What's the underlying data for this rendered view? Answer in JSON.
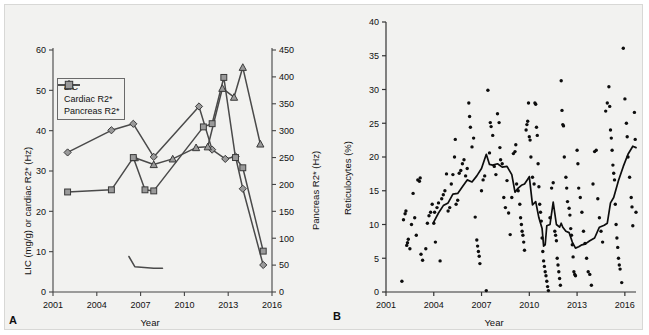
{
  "figure": {
    "background": "#f2f2f0",
    "panels": [
      "A",
      "B"
    ]
  },
  "panelA": {
    "letter": "A",
    "legend": {
      "items": [
        {
          "label": "LIC",
          "marker": "diamond-marker-icon",
          "color": "#8c8c8c"
        },
        {
          "label": "Cardiac R2*",
          "marker": "triangle-marker-icon",
          "color": "#8c8c8c"
        },
        {
          "label": "Pancreas R2*",
          "marker": "square-marker-icon",
          "color": "#8c8c8c"
        }
      ]
    },
    "chart_data": {
      "type": "line",
      "title": "",
      "xlabel": "Year",
      "ylabel": "LIC (mg/g) or cardiac R2* (Hz)",
      "ylabel_right": "Pancreas R2* (Hz)",
      "xlim": [
        2001,
        2016
      ],
      "xticks": [
        2001,
        2004,
        2007,
        2010,
        2013,
        2016
      ],
      "ylim": [
        0,
        60
      ],
      "yticks": [
        0,
        10,
        20,
        30,
        40,
        50,
        60
      ],
      "ylim_right": [
        0,
        450
      ],
      "yticks_right": [
        0,
        50,
        100,
        150,
        200,
        250,
        300,
        350,
        400,
        450
      ],
      "grid": false,
      "legend_position": "upper-left",
      "series": [
        {
          "name": "LIC",
          "axis": "left",
          "unit": "mg/g",
          "marker": "diamond",
          "x": [
            2002.0,
            2005.0,
            2006.5,
            2007.9,
            2011.0,
            2011.9,
            2012.8,
            2013.5,
            2014.0,
            2015.4
          ],
          "y": [
            34.6,
            40.1,
            41.7,
            33.5,
            46.0,
            35.3,
            33.0,
            33.6,
            25.6,
            6.7
          ]
        },
        {
          "name": "Cardiac R2*",
          "axis": "left",
          "unit": "Hz",
          "marker": "triangle",
          "x": [
            2006.6,
            2007.9,
            2009.2,
            2010.8,
            2011.6,
            2012.6,
            2013.4,
            2014.0,
            2015.2
          ],
          "y": [
            33.3,
            31.6,
            33.0,
            35.8,
            36.0,
            50.5,
            48.3,
            55.7,
            36.7
          ]
        },
        {
          "name": "Pancreas R2*",
          "axis": "right",
          "unit": "Hz",
          "marker": "square",
          "x": [
            2002.0,
            2005.0,
            2006.5,
            2007.3,
            2007.9,
            2011.3,
            2011.9,
            2012.7,
            2013.5,
            2014.0,
            2015.4
          ],
          "y": [
            186,
            190,
            250,
            190,
            188,
            307,
            313,
            399,
            250,
            231,
            76
          ]
        },
        {
          "name": "Pancreas R2* (early segment)",
          "axis": "right",
          "unit": "Hz",
          "marker": "none",
          "x": [
            2006.2,
            2006.6,
            2007.9,
            2008.5
          ],
          "y": [
            66,
            47,
            44,
            44
          ]
        }
      ]
    }
  },
  "panelB": {
    "letter": "B",
    "chart_data": {
      "type": "scatter",
      "title": "",
      "xlabel": "Year",
      "ylabel": "Reticulocytes (%)",
      "xlim": [
        2001,
        2016.7
      ],
      "xticks": [
        2001,
        2004,
        2007,
        2010,
        2013,
        2016
      ],
      "ylim": [
        0,
        40
      ],
      "yticks": [
        0,
        5,
        10,
        15,
        20,
        25,
        30,
        35,
        40
      ],
      "grid": false,
      "legend_position": "none",
      "series": [
        {
          "name": "Reticulocytes measurements",
          "marker": "dot",
          "points": [
            [
              2002.0,
              1.6
            ],
            [
              2002.1,
              10.7
            ],
            [
              2002.2,
              11.6
            ],
            [
              2002.25,
              12.0
            ],
            [
              2002.3,
              6.9
            ],
            [
              2002.35,
              7.3
            ],
            [
              2002.4,
              7.8
            ],
            [
              2002.5,
              6.4
            ],
            [
              2002.6,
              10.0
            ],
            [
              2002.7,
              14.6
            ],
            [
              2002.8,
              11.0
            ],
            [
              2002.9,
              8.4
            ],
            [
              2003.0,
              16.6
            ],
            [
              2003.1,
              16.4
            ],
            [
              2003.15,
              16.9
            ],
            [
              2003.2,
              5.6
            ],
            [
              2003.3,
              4.7
            ],
            [
              2003.5,
              6.4
            ],
            [
              2003.6,
              10.2
            ],
            [
              2003.7,
              11.3
            ],
            [
              2003.8,
              11.8
            ],
            [
              2003.9,
              13.0
            ],
            [
              2004.0,
              10.2
            ],
            [
              2004.05,
              11.8
            ],
            [
              2004.1,
              7.4
            ],
            [
              2004.2,
              12.5
            ],
            [
              2004.3,
              13.2
            ],
            [
              2004.4,
              4.6
            ],
            [
              2004.5,
              13.8
            ],
            [
              2004.6,
              14.4
            ],
            [
              2004.7,
              15.0
            ],
            [
              2004.8,
              17.5
            ],
            [
              2004.9,
              12.0
            ],
            [
              2005.0,
              12.5
            ],
            [
              2005.1,
              16.0
            ],
            [
              2005.2,
              17.4
            ],
            [
              2005.3,
              20.0
            ],
            [
              2005.35,
              22.6
            ],
            [
              2005.4,
              13.0
            ],
            [
              2005.5,
              13.6
            ],
            [
              2005.6,
              17.6
            ],
            [
              2005.7,
              18.0
            ],
            [
              2005.8,
              19.0
            ],
            [
              2005.9,
              19.6
            ],
            [
              2006.0,
              17.2
            ],
            [
              2006.1,
              18.3
            ],
            [
              2006.2,
              28.0
            ],
            [
              2006.25,
              26.0
            ],
            [
              2006.3,
              24.4
            ],
            [
              2006.4,
              21.5
            ],
            [
              2006.5,
              22.8
            ],
            [
              2006.6,
              11.1
            ],
            [
              2006.7,
              7.7
            ],
            [
              2006.75,
              6.8
            ],
            [
              2006.8,
              6.0
            ],
            [
              2006.85,
              5.3
            ],
            [
              2006.9,
              4.2
            ],
            [
              2007.0,
              15.0
            ],
            [
              2007.1,
              16.6
            ],
            [
              2007.2,
              17.2
            ],
            [
              2007.3,
              0.2
            ],
            [
              2007.4,
              29.9
            ],
            [
              2007.5,
              20.6
            ],
            [
              2007.55,
              25.1
            ],
            [
              2007.6,
              24.5
            ],
            [
              2007.7,
              23.2
            ],
            [
              2007.8,
              18.6
            ],
            [
              2007.9,
              17.4
            ],
            [
              2008.0,
              26.4
            ],
            [
              2008.1,
              25.1
            ],
            [
              2008.15,
              21.4
            ],
            [
              2008.2,
              19.6
            ],
            [
              2008.3,
              19.0
            ],
            [
              2008.4,
              14.0
            ],
            [
              2008.5,
              12.5
            ],
            [
              2008.6,
              16.5
            ],
            [
              2008.7,
              11.7
            ],
            [
              2008.8,
              8.5
            ],
            [
              2008.9,
              14.0
            ],
            [
              2009.0,
              20.5
            ],
            [
              2009.1,
              20.8
            ],
            [
              2009.15,
              21.8
            ],
            [
              2009.2,
              16.0
            ],
            [
              2009.3,
              15.0
            ],
            [
              2009.4,
              13.0
            ],
            [
              2009.45,
              11.0
            ],
            [
              2009.5,
              10.0
            ],
            [
              2009.55,
              9.0
            ],
            [
              2009.6,
              8.4
            ],
            [
              2009.65,
              7.4
            ],
            [
              2009.7,
              6.2
            ],
            [
              2009.8,
              24.0
            ],
            [
              2009.85,
              24.8
            ],
            [
              2009.9,
              25.3
            ],
            [
              2009.95,
              28.0
            ],
            [
              2010.0,
              23.0
            ],
            [
              2010.05,
              22.5
            ],
            [
              2010.1,
              20.0
            ],
            [
              2010.2,
              17.0
            ],
            [
              2010.3,
              16.0
            ],
            [
              2010.35,
              28.0
            ],
            [
              2010.4,
              27.8
            ],
            [
              2010.45,
              24.4
            ],
            [
              2010.5,
              23.2
            ],
            [
              2010.55,
              19.0
            ],
            [
              2010.6,
              15.6
            ],
            [
              2010.65,
              13.0
            ],
            [
              2010.7,
              11.8
            ],
            [
              2010.75,
              10.5
            ],
            [
              2010.8,
              8.0
            ],
            [
              2010.85,
              6.0
            ],
            [
              2010.9,
              4.6
            ],
            [
              2010.95,
              3.8
            ],
            [
              2011.0,
              3.0
            ],
            [
              2011.05,
              2.4
            ],
            [
              2011.1,
              1.6
            ],
            [
              2011.15,
              0.8
            ],
            [
              2011.2,
              0.2
            ],
            [
              2011.3,
              11.0
            ],
            [
              2011.4,
              15.4
            ],
            [
              2011.5,
              16.2
            ],
            [
              2011.6,
              9.0
            ],
            [
              2011.65,
              8.4
            ],
            [
              2011.7,
              7.6
            ],
            [
              2011.75,
              5.0
            ],
            [
              2011.8,
              4.0
            ],
            [
              2011.85,
              3.0
            ],
            [
              2011.9,
              2.0
            ],
            [
              2011.95,
              1.0
            ],
            [
              2012.0,
              31.3
            ],
            [
              2012.05,
              26.9
            ],
            [
              2012.1,
              24.8
            ],
            [
              2012.15,
              24.6
            ],
            [
              2012.2,
              20.0
            ],
            [
              2012.3,
              17.0
            ],
            [
              2012.35,
              15.4
            ],
            [
              2012.4,
              13.4
            ],
            [
              2012.5,
              12.4
            ],
            [
              2012.55,
              11.4
            ],
            [
              2012.6,
              9.4
            ],
            [
              2012.65,
              8.4
            ],
            [
              2012.7,
              7.0
            ],
            [
              2012.75,
              5.2
            ],
            [
              2012.8,
              3.0
            ],
            [
              2012.85,
              2.6
            ],
            [
              2012.9,
              2.4
            ],
            [
              2013.0,
              21.0
            ],
            [
              2013.05,
              19.0
            ],
            [
              2013.1,
              15.4
            ],
            [
              2013.2,
              14.0
            ],
            [
              2013.3,
              11.8
            ],
            [
              2013.4,
              9.0
            ],
            [
              2013.5,
              7.2
            ],
            [
              2013.6,
              5.0
            ],
            [
              2013.7,
              3.0
            ],
            [
              2013.8,
              2.6
            ],
            [
              2013.9,
              1.0
            ],
            [
              2014.0,
              16.0
            ],
            [
              2014.1,
              20.8
            ],
            [
              2014.2,
              21.0
            ],
            [
              2014.3,
              13.8
            ],
            [
              2014.4,
              11.0
            ],
            [
              2014.5,
              9.0
            ],
            [
              2014.6,
              7.4
            ],
            [
              2014.8,
              26.8
            ],
            [
              2014.9,
              28.0
            ],
            [
              2015.0,
              30.4
            ],
            [
              2015.05,
              27.5
            ],
            [
              2015.1,
              24.0
            ],
            [
              2015.15,
              22.8
            ],
            [
              2015.2,
              21.0
            ],
            [
              2015.25,
              18.8
            ],
            [
              2015.3,
              17.6
            ],
            [
              2015.35,
              16.6
            ],
            [
              2015.4,
              13.0
            ],
            [
              2015.45,
              10.0
            ],
            [
              2015.5,
              8.0
            ],
            [
              2015.55,
              6.6
            ],
            [
              2015.6,
              5.0
            ],
            [
              2015.65,
              4.0
            ],
            [
              2015.7,
              3.4
            ],
            [
              2015.8,
              1.4
            ],
            [
              2015.9,
              36.1
            ],
            [
              2016.0,
              28.6
            ],
            [
              2016.1,
              25.0
            ],
            [
              2016.15,
              23.0
            ],
            [
              2016.2,
              20.0
            ],
            [
              2016.3,
              17.0
            ],
            [
              2016.4,
              14.0
            ],
            [
              2016.45,
              12.6
            ],
            [
              2016.5,
              9.8
            ],
            [
              2016.6,
              26.6
            ],
            [
              2016.65,
              22.6
            ],
            [
              2016.7,
              11.8
            ]
          ]
        }
      ],
      "trend_line": {
        "name": "Rolling mean reticulocytes",
        "x": [
          2004.0,
          2004.3,
          2004.6,
          2004.9,
          2005.2,
          2005.5,
          2005.8,
          2006.1,
          2006.4,
          2006.7,
          2007.0,
          2007.3,
          2007.5,
          2007.7,
          2008.0,
          2008.3,
          2008.6,
          2008.9,
          2009.1,
          2009.3,
          2009.5,
          2009.7,
          2009.9,
          2010.0,
          2010.2,
          2010.4,
          2010.6,
          2010.8,
          2010.9,
          2011.0,
          2011.1,
          2011.3,
          2011.5,
          2011.7,
          2011.9,
          2012.0,
          2012.1,
          2012.3,
          2012.5,
          2012.7,
          2012.9,
          2013.1,
          2013.3,
          2013.5,
          2013.8,
          2014.1,
          2014.4,
          2014.7,
          2014.9,
          2015.1,
          2015.3,
          2015.6,
          2015.9,
          2016.2,
          2016.5,
          2016.7
        ],
        "y": [
          10.4,
          11.7,
          12.8,
          13.2,
          14.5,
          14.6,
          15.6,
          16.6,
          16.3,
          17.2,
          18.3,
          20.4,
          18.9,
          18.8,
          19.0,
          18.5,
          18.6,
          17.4,
          14.8,
          15.4,
          15.8,
          16.0,
          16.7,
          17.1,
          12.9,
          13.4,
          11.0,
          9.4,
          6.8,
          7.0,
          9.8,
          10.0,
          13.3,
          10.0,
          9.6,
          10.2,
          9.6,
          9.0,
          8.8,
          7.4,
          6.5,
          6.7,
          7.0,
          7.1,
          7.6,
          8.0,
          9.6,
          9.9,
          10.2,
          13.2,
          14.0,
          16.5,
          18.6,
          20.4,
          21.6,
          21.4
        ]
      }
    }
  }
}
